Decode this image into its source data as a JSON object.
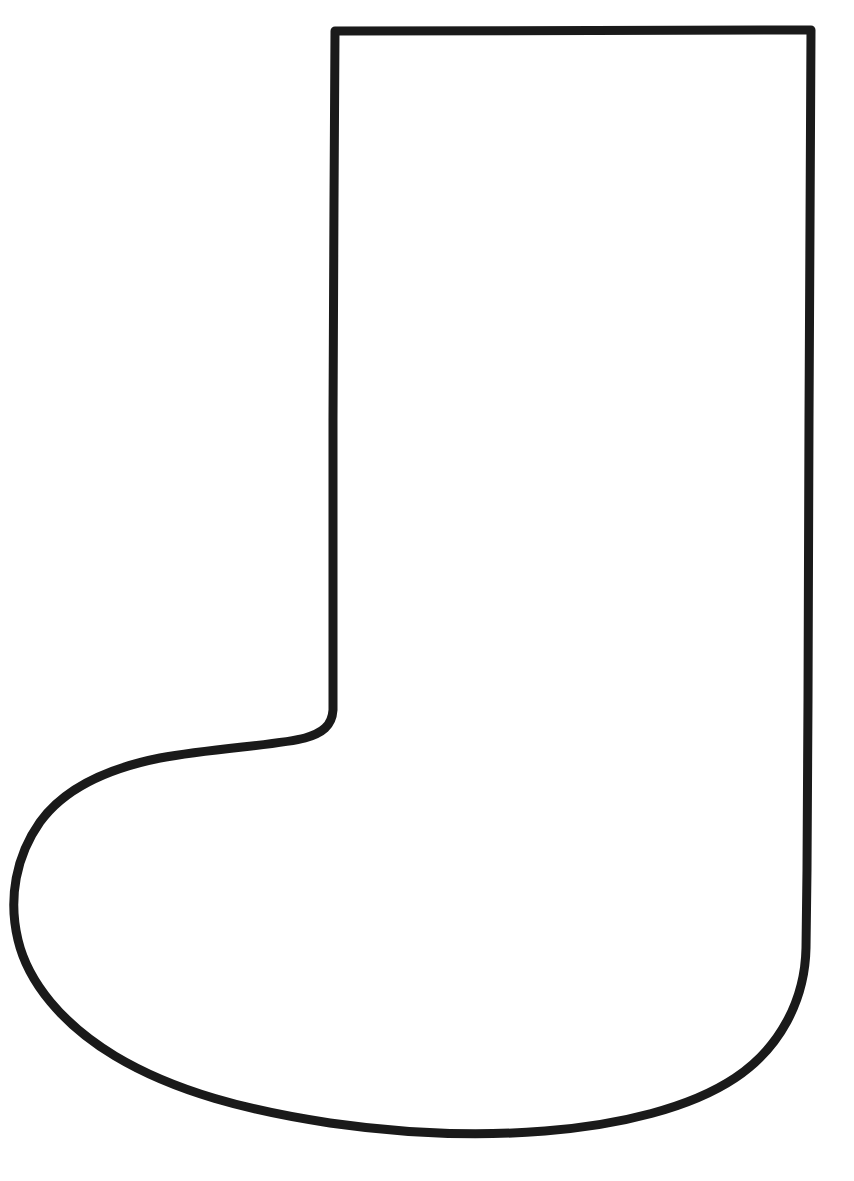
{
  "page": {
    "background_color": "#ffffff",
    "width": 854,
    "height": 1181,
    "alt_text": "Black outline drawing of a Christmas stocking / boot shape"
  },
  "drawing": {
    "name": "stocking-boot-outline",
    "description": "Single closed outline of a tall boot (Christmas stocking) shape with a straight tall leg, rounded heel and a rounded toe",
    "stroke_color": "#1a1a1a",
    "fill_color": "none",
    "stroke_width": 9,
    "stroke_linejoin": "round",
    "stroke_linecap": "round",
    "bounds": {
      "left": 15,
      "top": 28,
      "right": 814,
      "bottom": 1136
    },
    "key_points": {
      "top_left_corner": [
        335,
        31
      ],
      "top_right_corner": [
        811,
        30
      ],
      "right_edge_x": 808,
      "right_curve_start": [
        806,
        945
      ],
      "bottom_right": [
        700,
        1098
      ],
      "sole_lowest": [
        400,
        1133
      ],
      "toe_leftmost": [
        16,
        928
      ],
      "ankle_line_left": [
        60,
        792
      ],
      "ankle_inner_corner": [
        333,
        716
      ],
      "leg_left_edge_x": 333
    },
    "path": "M 335 31 L 811 30 L 809 420 L 808 700 L 807 870 L 806 948 C 805 1000 780 1048 735 1078 C 690 1108 620 1125 545 1131 C 470 1137 400 1133 330 1123 C 250 1111 175 1092 115 1056 C 62 1024 28 982 18 940 C 8 898 16 856 40 822 C 66 786 110 768 160 758 C 215 748 280 745 305 738 C 322 733 332 726 333 710 L 333 600 L 333 420 L 334 200 Z"
  }
}
